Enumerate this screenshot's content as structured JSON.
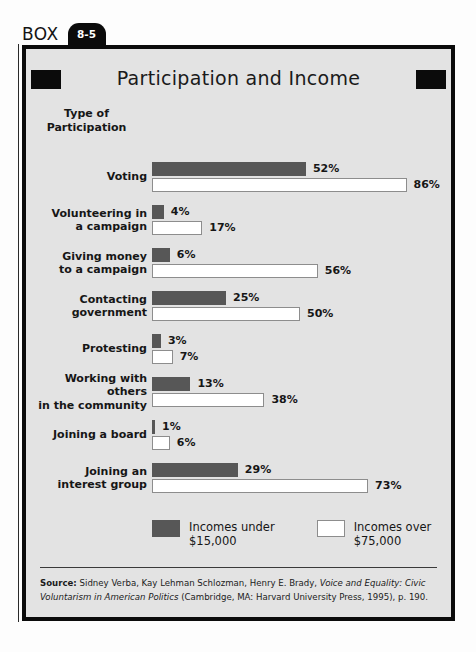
{
  "box": {
    "word": "BOX",
    "number": "8-5"
  },
  "title": "Participation and Income",
  "chart_data": {
    "type": "bar",
    "orientation": "horizontal-grouped",
    "title": "Participation and Income",
    "axis_header": "Type of\nParticipation",
    "xlabel": "",
    "ylabel": "Type of Participation",
    "xlim": [
      0,
      100
    ],
    "grid": false,
    "legend_position": "bottom",
    "categories": [
      "Voting",
      "Volunteering in a campaign",
      "Giving money to a campaign",
      "Contacting government",
      "Protesting",
      "Working with others in the community",
      "Joining a board",
      "Joining an interest group"
    ],
    "series": [
      {
        "name": "Incomes under $15,000",
        "color": "#575757",
        "values": [
          52,
          4,
          6,
          25,
          3,
          13,
          1,
          29
        ]
      },
      {
        "name": "Incomes over $75,000",
        "color": "#ffffff",
        "values": [
          86,
          17,
          56,
          50,
          7,
          38,
          6,
          73
        ]
      }
    ]
  },
  "rows": [
    {
      "label": "Voting",
      "low_value": 52,
      "low_label": "52%",
      "high_value": 86,
      "high_label": "86%"
    },
    {
      "label": "Volunteering in\na campaign",
      "low_value": 4,
      "low_label": "4%",
      "high_value": 17,
      "high_label": "17%"
    },
    {
      "label": "Giving money\nto a campaign",
      "low_value": 6,
      "low_label": "6%",
      "high_value": 56,
      "high_label": "56%"
    },
    {
      "label": "Contacting\ngovernment",
      "low_value": 25,
      "low_label": "25%",
      "high_value": 50,
      "high_label": "50%"
    },
    {
      "label": "Protesting",
      "low_value": 3,
      "low_label": "3%",
      "high_value": 7,
      "high_label": "7%"
    },
    {
      "label": "Working with others\nin the community",
      "low_value": 13,
      "low_label": "13%",
      "high_value": 38,
      "high_label": "38%"
    },
    {
      "label": "Joining a board",
      "low_value": 1,
      "low_label": "1%",
      "high_value": 6,
      "high_label": "6%"
    },
    {
      "label": "Joining an\ninterest group",
      "low_value": 29,
      "low_label": "29%",
      "high_value": 73,
      "high_label": "73%"
    }
  ],
  "legend": [
    {
      "text": "Incomes under\n$15,000",
      "color": "#575757"
    },
    {
      "text": "Incomes over\n$75,000",
      "color": "#ffffff"
    }
  ],
  "source": {
    "label": "Source:",
    "text_before_italic": " Sidney Verba, Kay Lehman Schlozman, Henry E. Brady, ",
    "italic": "Voice and Equality: Civic Voluntarism in American Politics",
    "text_after_italic": " (Cambridge, MA: Harvard University Press, 1995), p. 190."
  },
  "colors": {
    "low_income_bar": "#575757",
    "high_income_bar": "#ffffff",
    "box_background": "#e3e3e3",
    "frame": "#0b0b0b"
  },
  "scale": {
    "px_per_percent": 2.96,
    "bar_origin_px": 126
  }
}
